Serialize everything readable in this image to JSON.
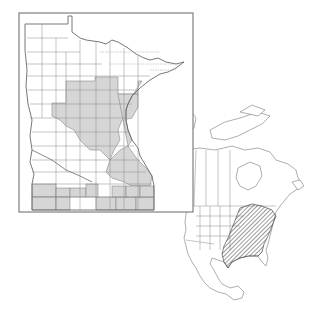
{
  "figure": {
    "type": "distribution-map",
    "colors": {
      "background": "#ffffff",
      "outline": "#555555",
      "county_line": "#777777",
      "shaded_county": "#d6d6d6",
      "hatch": "#333333",
      "frame": "#666666"
    }
  },
  "minnesota_map": {
    "label": "Minnesota counties",
    "legend": {
      "shaded": "county record present",
      "unshaded": "no record"
    },
    "shaded_region_summary": "Central, east-central, south-eastern and southern tier counties shaded gray"
  },
  "north_america_map": {
    "label": "North American range",
    "hatched_region_summary": "Eastern United States, from Great Lakes south to Gulf coast and east to Atlantic"
  }
}
